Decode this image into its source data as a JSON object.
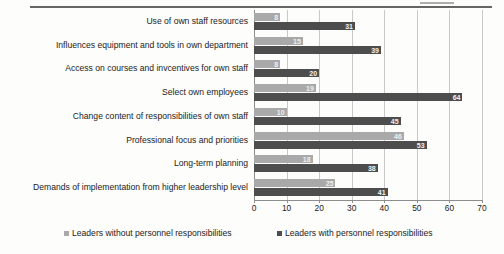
{
  "chart_data": {
    "type": "bar",
    "orientation": "horizontal",
    "title": "",
    "subtitle": "",
    "xlabel": "",
    "ylabel": "",
    "xlim": [
      0,
      70
    ],
    "xticks": [
      0,
      10,
      20,
      30,
      40,
      50,
      60,
      70
    ],
    "grid": true,
    "legend_position": "bottom",
    "categories": [
      "Use of own staff resources",
      "Influences equipment and tools in own department",
      "Access on courses and invcentives for own staff",
      "Select own employees",
      "Change content of responsibilities of own staff",
      "Professional focus and priorities",
      "Long-term planning",
      "Demands of implementation from higher leadership level"
    ],
    "series": [
      {
        "name": "Leaders without personnel responsibilities",
        "color": "#a9a9a9",
        "values": [
          8,
          15,
          8,
          19,
          10,
          46,
          18,
          25
        ],
        "labels": [
          "8",
          "15",
          "8",
          "19",
          "10",
          "46",
          "18",
          "25"
        ]
      },
      {
        "name": "Leaders with personnel responsibilities",
        "color": "#4d4d4d",
        "values": [
          31,
          39,
          20,
          64,
          45,
          53,
          38,
          41
        ],
        "labels": [
          "31",
          "39",
          "20",
          "64",
          "45",
          "53",
          "38",
          "41"
        ]
      }
    ]
  },
  "legend": {
    "items": [
      {
        "label": "Leaders without personnel responsibilities"
      },
      {
        "label": "Leaders with personnel responsibilities"
      }
    ]
  }
}
